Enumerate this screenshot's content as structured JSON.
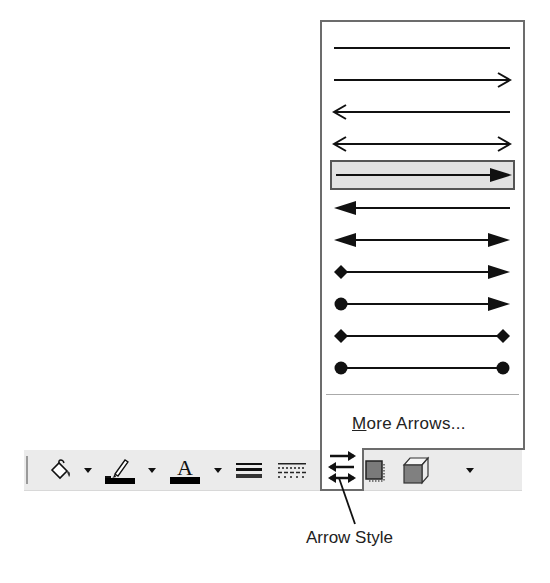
{
  "toolbar": {
    "items": [
      {
        "name": "fill-color",
        "icon": "paint-bucket-icon",
        "has_dropdown": true
      },
      {
        "name": "line-color",
        "icon": "paintbrush-icon",
        "has_dropdown": true,
        "swatch_color": "#000000"
      },
      {
        "name": "font-color",
        "icon": "letter-a-icon",
        "glyph": "A",
        "has_dropdown": true,
        "swatch_color": "#000000"
      },
      {
        "name": "line-style",
        "icon": "line-style-icon"
      },
      {
        "name": "dash-style",
        "icon": "dash-style-icon"
      },
      {
        "name": "arrow-style",
        "icon": "arrow-style-icon",
        "active": true
      },
      {
        "name": "shadow-style",
        "icon": "shadow-icon"
      },
      {
        "name": "3d-style",
        "icon": "cube-3d-icon"
      },
      {
        "name": "toolbar-options",
        "icon": "chevron-down-icon"
      }
    ]
  },
  "arrow_menu": {
    "options": [
      {
        "id": 1,
        "start": "none",
        "end": "none"
      },
      {
        "id": 2,
        "start": "none",
        "end": "open-arrow"
      },
      {
        "id": 3,
        "start": "open-arrow",
        "end": "none"
      },
      {
        "id": 4,
        "start": "open-arrow",
        "end": "open-arrow"
      },
      {
        "id": 5,
        "start": "none",
        "end": "solid-arrow",
        "selected": true
      },
      {
        "id": 6,
        "start": "solid-arrow",
        "end": "none"
      },
      {
        "id": 7,
        "start": "solid-arrow",
        "end": "solid-arrow"
      },
      {
        "id": 8,
        "start": "diamond",
        "end": "solid-arrow"
      },
      {
        "id": 9,
        "start": "circle",
        "end": "solid-arrow"
      },
      {
        "id": 10,
        "start": "diamond",
        "end": "diamond"
      },
      {
        "id": 11,
        "start": "circle",
        "end": "circle"
      }
    ],
    "more_label_mnemonic": "M",
    "more_label_rest": "ore Arrows..."
  },
  "callout": {
    "label": "Arrow Style"
  }
}
